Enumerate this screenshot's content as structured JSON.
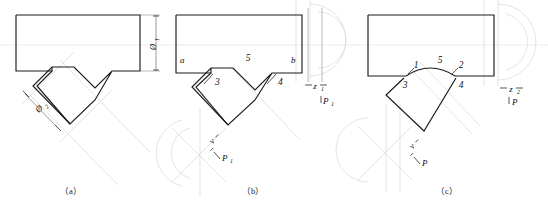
{
  "figure": {
    "type": "engineering-drawing",
    "panel_count": 3
  },
  "panels": [
    {
      "id": "a",
      "caption": "（a）",
      "dimensions": [
        {
          "name": "diameter-1",
          "symbol": "Ø",
          "subscript": "1",
          "orientation": "vertical"
        },
        {
          "name": "diameter-2",
          "symbol": "Ø",
          "subscript": "2",
          "orientation": "diagonal"
        }
      ],
      "point_labels": [],
      "vectors": []
    },
    {
      "id": "b",
      "caption": "（b）",
      "dimensions": [],
      "point_labels": [
        {
          "text": "a",
          "position": "left-inside"
        },
        {
          "text": "5",
          "position": "center-inside"
        },
        {
          "text": "b",
          "position": "right-inside"
        },
        {
          "text": "3",
          "position": "notch-left"
        },
        {
          "text": "4",
          "position": "notch-right"
        }
      ],
      "vectors": [
        {
          "text": "z",
          "subscript": "1",
          "position": "right-vertical"
        },
        {
          "text": "P",
          "subscript": "1",
          "position": "right-lower"
        },
        {
          "text": "v",
          "subscript": "",
          "position": "lower-left-diagonal"
        },
        {
          "text": "P",
          "subscript": "1",
          "position": "lower-left-diagonal"
        }
      ]
    },
    {
      "id": "c",
      "caption": "（c）",
      "dimensions": [],
      "point_labels": [
        {
          "text": "1",
          "position": "arc-left"
        },
        {
          "text": "5",
          "position": "arc-center"
        },
        {
          "text": "2",
          "position": "arc-right"
        },
        {
          "text": "3",
          "position": "notch-left"
        },
        {
          "text": "4",
          "position": "notch-right"
        }
      ],
      "vectors": [
        {
          "text": "z",
          "subscript": "2",
          "position": "right-vertical"
        },
        {
          "text": "P",
          "subscript": "",
          "position": "right-lower"
        },
        {
          "text": "v",
          "subscript": "",
          "position": "lower-left-diagonal"
        },
        {
          "text": "P",
          "subscript": "",
          "position": "lower-left-diagonal"
        }
      ]
    }
  ],
  "colors": {
    "outline": "#1a1a1a",
    "dimension": "#555555",
    "ghost": "#d8d8d8",
    "text": "#111111",
    "background": "#ffffff"
  },
  "symbols": {
    "diameter": "Ø",
    "sub_1": "1",
    "sub_2": "2"
  },
  "labels": {
    "a": "a",
    "b": "b",
    "n1": "1",
    "n2": "2",
    "n3": "3",
    "n4": "4",
    "n5": "5",
    "z": "z",
    "P": "P",
    "v": "v"
  },
  "captions": {
    "a": "（a）",
    "b": "（b）",
    "c": "（c）"
  }
}
